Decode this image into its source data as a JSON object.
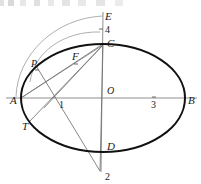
{
  "figure": {
    "colors": {
      "ellipse_stroke": "#111111",
      "construction_line": "#6b6b6b",
      "arc_line": "#8a8a8a",
      "axis_line": "#8f8f8f",
      "label_text": "#1a1a1a",
      "background": "#ffffff"
    },
    "labels": [
      {
        "id": "A",
        "text": "A",
        "x": 10,
        "y": 104,
        "style": "italic"
      },
      {
        "id": "B",
        "text": "B",
        "x": 188,
        "y": 104,
        "style": "italic"
      },
      {
        "id": "C",
        "text": "C",
        "x": 107,
        "y": 47,
        "style": "italic"
      },
      {
        "id": "D",
        "text": "D",
        "x": 107,
        "y": 150,
        "style": "italic"
      },
      {
        "id": "E",
        "text": "E",
        "x": 105,
        "y": 20,
        "style": "italic"
      },
      {
        "id": "F",
        "text": "F",
        "x": 72,
        "y": 60,
        "style": "italic"
      },
      {
        "id": "O",
        "text": "O",
        "x": 107,
        "y": 94,
        "style": "italic"
      },
      {
        "id": "P",
        "text": "P",
        "x": 31,
        "y": 67,
        "style": "italic"
      },
      {
        "id": "T",
        "text": "T",
        "x": 22,
        "y": 130,
        "style": "italic"
      },
      {
        "id": "n1",
        "text": "1",
        "x": 59,
        "y": 108,
        "style": "roman"
      },
      {
        "id": "n2",
        "text": "2",
        "x": 105,
        "y": 180,
        "style": "roman"
      },
      {
        "id": "n3",
        "text": "3",
        "x": 155,
        "y": 108,
        "style": "roman"
      },
      {
        "id": "n4",
        "text": "4",
        "x": 105,
        "y": 33,
        "style": "roman"
      }
    ],
    "points": {
      "A": {
        "x": 21,
        "y": 98
      },
      "B": {
        "x": 185,
        "y": 98
      },
      "C": {
        "x": 103,
        "y": 44
      },
      "D": {
        "x": 103,
        "y": 146
      },
      "E": {
        "x": 103,
        "y": 16
      },
      "O": {
        "x": 103,
        "y": 98
      },
      "P": {
        "x": 35,
        "y": 63
      },
      "F": {
        "x": 74,
        "y": 57
      },
      "T": {
        "x": 31,
        "y": 122
      },
      "p1": {
        "x": 55,
        "y": 100
      },
      "p2": {
        "x": 100,
        "y": 171
      },
      "p3": {
        "x": 154,
        "y": 98
      },
      "p4": {
        "x": 101,
        "y": 29
      }
    },
    "ellipse": {
      "cx": 103,
      "cy": 98,
      "rx": 82,
      "ry": 54
    },
    "tick_marks": [
      {
        "id": "tick-4",
        "x": 101,
        "y": 29
      },
      {
        "id": "tick-3",
        "x": 154,
        "y": 98
      },
      {
        "id": "tick-P",
        "x": 37,
        "y": 70
      },
      {
        "id": "tick-F",
        "x": 76,
        "y": 64
      }
    ],
    "segments": [
      {
        "id": "seg-A-C",
        "from": "A",
        "to": "C"
      },
      {
        "id": "seg-P-2",
        "from": "P",
        "to": "p2"
      },
      {
        "id": "seg-C-T",
        "from": "C",
        "to": "T"
      },
      {
        "id": "seg-C-1",
        "from": "C",
        "to": "p1"
      },
      {
        "id": "seg-C-D-2",
        "from": "C",
        "to": "p2"
      },
      {
        "id": "seg-A-F",
        "from": "A",
        "to": "F"
      }
    ],
    "arcs": [
      {
        "id": "arc-A-E",
        "description": "long auxiliary arc from near A up to E"
      },
      {
        "id": "arc-P-C",
        "description": "shorter auxiliary arc from near P to C"
      }
    ],
    "axes": [
      {
        "id": "major-axis",
        "orientation": "horizontal",
        "from": "A",
        "to": "B"
      },
      {
        "id": "minor-axis",
        "orientation": "vertical",
        "from": "E",
        "to": "p2"
      }
    ]
  }
}
